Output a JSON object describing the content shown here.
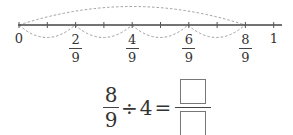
{
  "number_line": {
    "start_label": "0",
    "end_label": "1",
    "denominator": "9",
    "marks": [
      {
        "num": "2",
        "den": "9"
      },
      {
        "num": "4",
        "den": "9"
      },
      {
        "num": "6",
        "den": "9"
      },
      {
        "num": "8",
        "den": "9"
      }
    ]
  },
  "equation": {
    "numerator": "8",
    "denominator": "9",
    "operator": "÷",
    "divisor": "4",
    "equals": "="
  }
}
